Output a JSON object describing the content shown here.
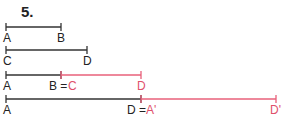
{
  "title": "5.",
  "colors": {
    "black": "#333333",
    "red": "#e8607a"
  },
  "rows": [
    {
      "y": 27,
      "segments": [
        {
          "x1": 6,
          "x2": 61,
          "color": "black"
        }
      ],
      "labels": [
        {
          "x": 3,
          "text": "A",
          "color": "black"
        },
        {
          "x": 57,
          "text": "B",
          "color": "black"
        }
      ]
    },
    {
      "y": 50,
      "segments": [
        {
          "x1": 6,
          "x2": 87,
          "color": "black"
        }
      ],
      "labels": [
        {
          "x": 3,
          "text": "C",
          "color": "black"
        },
        {
          "x": 83,
          "text": "D",
          "color": "black"
        }
      ]
    },
    {
      "y": 75,
      "segments": [
        {
          "x1": 6,
          "x2": 61,
          "color": "black"
        },
        {
          "x1": 61,
          "x2": 141,
          "color": "red"
        }
      ],
      "labels": [
        {
          "x": 3,
          "text": "A",
          "color": "black"
        },
        {
          "x": 49,
          "text": "B = ",
          "color": "black"
        },
        {
          "x": 68,
          "text": "C",
          "color": "red"
        },
        {
          "x": 137,
          "text": "D",
          "color": "red"
        }
      ]
    },
    {
      "y": 99,
      "segments": [
        {
          "x1": 6,
          "x2": 141,
          "color": "black"
        },
        {
          "x1": 141,
          "x2": 276,
          "color": "red"
        }
      ],
      "labels": [
        {
          "x": 3,
          "text": "A",
          "color": "black"
        },
        {
          "x": 127,
          "text": "D = ",
          "color": "black"
        },
        {
          "x": 146,
          "text": "A'",
          "color": "red"
        },
        {
          "x": 270,
          "text": "D'",
          "color": "red"
        }
      ]
    }
  ]
}
